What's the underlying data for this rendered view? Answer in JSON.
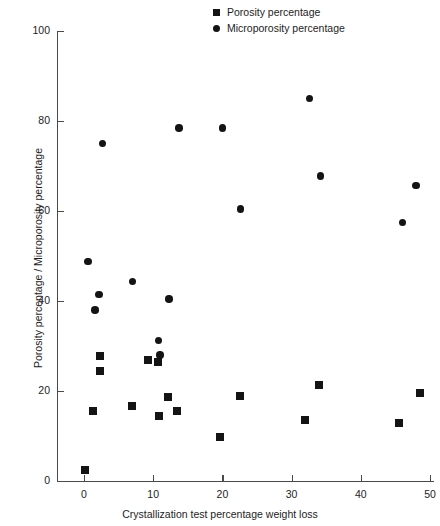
{
  "chart_data": {
    "type": "scatter",
    "title": "",
    "xlabel": "Crystallization test percentage weight loss",
    "ylabel": "Porosity percentage / Microporosity percentage",
    "xlim": [
      0,
      50
    ],
    "ylim": [
      0,
      100
    ],
    "xticks": [
      0,
      10,
      20,
      30,
      40,
      50
    ],
    "yticks": [
      0,
      20,
      40,
      60,
      80,
      100
    ],
    "xtick_labels": [
      "0",
      "10",
      "20",
      "30",
      "40",
      "50"
    ],
    "ytick_labels": [
      "0",
      "20",
      "40",
      "60",
      "80",
      "100"
    ],
    "grid": false,
    "legend_position": "top-center",
    "marker_color": "#141414",
    "axis_color": "#4a4a4a",
    "series": [
      {
        "name": "Porosity percentage",
        "marker": "square",
        "points": [
          [
            0.2,
            2.5
          ],
          [
            1.3,
            15.5
          ],
          [
            2.3,
            27.7
          ],
          [
            2.3,
            24.4
          ],
          [
            7.0,
            16.7
          ],
          [
            9.2,
            27.0
          ],
          [
            10.7,
            26.5
          ],
          [
            10.8,
            14.4
          ],
          [
            12.1,
            18.7
          ],
          [
            13.4,
            15.6
          ],
          [
            19.6,
            9.8
          ],
          [
            22.6,
            18.9
          ],
          [
            31.9,
            13.5
          ],
          [
            33.9,
            21.4
          ],
          [
            45.5,
            12.8
          ],
          [
            48.5,
            19.6
          ]
        ]
      },
      {
        "name": "Microporosity percentage",
        "marker": "circle",
        "points": [
          [
            0.6,
            48.8
          ],
          [
            1.6,
            38.0
          ],
          [
            2.2,
            41.5
          ],
          [
            2.7,
            75.0
          ],
          [
            7.0,
            44.3
          ],
          [
            10.8,
            31.2
          ],
          [
            11.0,
            28.0
          ],
          [
            12.3,
            40.5
          ],
          [
            13.7,
            78.5
          ],
          [
            20.0,
            78.5
          ],
          [
            22.6,
            60.5
          ],
          [
            32.6,
            85.0
          ],
          [
            34.2,
            67.8
          ],
          [
            46.0,
            57.5
          ],
          [
            48.0,
            65.7
          ]
        ]
      }
    ]
  },
  "legend": {
    "items": [
      {
        "label": "Porosity percentage",
        "marker": "square"
      },
      {
        "label": "Microporosity percentage",
        "marker": "circle"
      }
    ]
  }
}
